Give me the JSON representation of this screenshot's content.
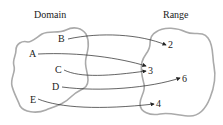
{
  "titles": {
    "domain": "Domain",
    "range": "Range"
  },
  "domain_elements": [
    {
      "label": "A",
      "x": 33,
      "y": 57
    },
    {
      "label": "B",
      "x": 62,
      "y": 42
    },
    {
      "label": "C",
      "x": 58,
      "y": 73
    },
    {
      "label": "D",
      "x": 56,
      "y": 90
    },
    {
      "label": "E",
      "x": 33,
      "y": 103
    }
  ],
  "range_elements": [
    {
      "label": "2",
      "x": 168,
      "y": 48
    },
    {
      "label": "3",
      "x": 148,
      "y": 73
    },
    {
      "label": "6",
      "x": 182,
      "y": 82
    },
    {
      "label": "4",
      "x": 156,
      "y": 106
    }
  ],
  "mappings": [
    {
      "from": "A",
      "to": "3"
    },
    {
      "from": "B",
      "to": "2"
    },
    {
      "from": "C",
      "to": "3"
    },
    {
      "from": "D",
      "to": "6"
    },
    {
      "from": "E",
      "to": "4"
    }
  ]
}
